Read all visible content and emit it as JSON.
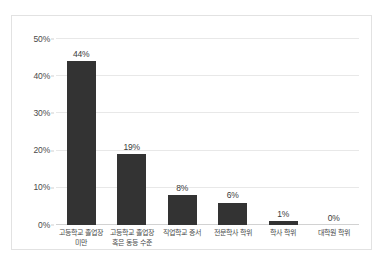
{
  "chart_data": {
    "type": "bar",
    "title": "",
    "xlabel": "",
    "ylabel": "",
    "categories": [
      "고등학교 졸업장 미만",
      "고등학교 졸업장 혹은 동등 수준",
      "직업학교 증서",
      "전문학사 학위",
      "학사 학위",
      "대학원 학위"
    ],
    "values": [
      44,
      19,
      8,
      6,
      1,
      0
    ],
    "value_labels": [
      "44%",
      "19%",
      "8%",
      "6%",
      "1%",
      "0%"
    ],
    "ylim": [
      0,
      50
    ],
    "y_ticks": [
      0,
      10,
      20,
      30,
      40,
      50
    ],
    "y_tick_labels": [
      "0%",
      "10%",
      "20%",
      "30%",
      "40%",
      "50%"
    ],
    "grid": true,
    "legend": "none",
    "bar_color": "#333333",
    "gridline_color": "#e8e8e8",
    "frame_color": "#e2e2e2"
  },
  "caption": {
    "text": ""
  }
}
